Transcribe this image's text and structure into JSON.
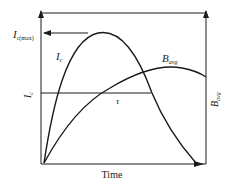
{
  "diagram": {
    "x_axis_label": "Time",
    "labels": {
      "ic_max_main": "I",
      "ic_max_sub": "c(max)",
      "ic_curve_main": "I",
      "ic_curve_sub": "c",
      "ic_level_main": "I",
      "ic_level_sub": "c",
      "bavg_curve_main": "B",
      "bavg_curve_sub": "avg",
      "bavg_axis_main": "B",
      "bavg_axis_sub": "avg",
      "tau": "τ"
    },
    "colors": {
      "line": "#1a1a1a",
      "text": "#222222"
    }
  }
}
